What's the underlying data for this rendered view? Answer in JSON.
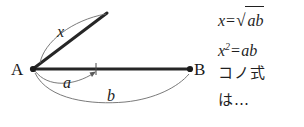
{
  "figure": {
    "type": "geometric-diagram",
    "background_color": "#ffffff",
    "ink_color": "#1f1f1f",
    "points": [
      {
        "id": "A",
        "label": "A",
        "x": 33,
        "y": 69
      },
      {
        "id": "B",
        "label": "B",
        "x": 190,
        "y": 69
      }
    ],
    "segments": [
      {
        "id": "ab",
        "name": "segment-a-b",
        "style": "thick",
        "from": [
          33,
          69
        ],
        "to": [
          190,
          69
        ]
      },
      {
        "id": "x",
        "name": "segment-x",
        "style": "thick",
        "from": [
          33,
          69
        ],
        "to": [
          107,
          13
        ]
      }
    ],
    "tick": {
      "name": "tick-mark-a-endpoint",
      "x": 96,
      "y": 69
    },
    "arcs": [
      {
        "id": "x",
        "label": "x",
        "name": "arc-label-x",
        "from": [
          40,
          62
        ],
        "to": [
          106,
          14
        ],
        "bulge": "up-left"
      },
      {
        "id": "a",
        "label": "a",
        "name": "arc-label-a",
        "from": [
          35,
          72
        ],
        "to": [
          96,
          71
        ],
        "bulge": "down",
        "arrowhead": "end"
      },
      {
        "id": "b",
        "label": "b",
        "name": "arc-label-b",
        "from": [
          35,
          74
        ],
        "to": [
          189,
          74
        ],
        "bulge": "down"
      }
    ]
  },
  "equations": {
    "lines": [
      {
        "id": "eq-x-sqrt-ab",
        "kind": "math",
        "lhs": "x",
        "relation": "=",
        "radicand": "ab",
        "plain": "x=√ab"
      },
      {
        "id": "eq-x-squared-ab",
        "kind": "math",
        "lhs": "x",
        "exponent": "2",
        "relation": "=",
        "rhs": "ab",
        "plain": "x²=ab"
      },
      {
        "id": "note-kono-shiki",
        "kind": "text",
        "plain": "コノ式"
      },
      {
        "id": "note-wa-ellipsis",
        "kind": "text",
        "plain": "は…"
      }
    ]
  }
}
